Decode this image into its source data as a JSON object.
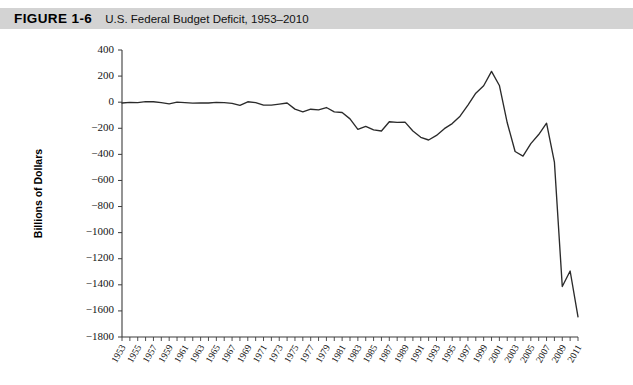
{
  "header": {
    "figure_number": "FIGURE 1-6",
    "figure_title": "U.S. Federal Budget Deficit, 1953–2010",
    "band_color": "#d3d3d3"
  },
  "chart_data": {
    "type": "line",
    "title": "U.S. Federal Budget Deficit, 1953–2010",
    "xlabel": "",
    "ylabel": "Billions of Dollars",
    "xlim": [
      1953,
      2011
    ],
    "ylim": [
      -1800,
      400
    ],
    "ytick_step": 200,
    "grid": false,
    "legend": "none",
    "line_color": "#2b2b2b",
    "ytick_labels": [
      "400",
      "200",
      "0",
      "−200",
      "−400",
      "−600",
      "−800",
      "−1000",
      "−1200",
      "−1400",
      "−1600",
      "−1800"
    ],
    "ytick_values": [
      400,
      200,
      0,
      -200,
      -400,
      -600,
      -800,
      -1000,
      -1200,
      -1400,
      -1600,
      -1800
    ],
    "xtick_labels": [
      "1953",
      "1955",
      "1957",
      "1959",
      "1961",
      "1963",
      "1965",
      "1967",
      "1969",
      "1971",
      "1973",
      "1975",
      "1977",
      "1979",
      "1981",
      "1983",
      "1985",
      "1987",
      "1989",
      "1991",
      "1993",
      "1995",
      "1997",
      "1999",
      "2001",
      "2003",
      "2005",
      "2007",
      "2009",
      "2011"
    ],
    "xtick_values": [
      1953,
      1955,
      1957,
      1959,
      1961,
      1963,
      1965,
      1967,
      1969,
      1971,
      1973,
      1975,
      1977,
      1979,
      1981,
      1983,
      1985,
      1987,
      1989,
      1991,
      1993,
      1995,
      1997,
      1999,
      2001,
      2003,
      2005,
      2007,
      2009,
      2011
    ],
    "x": [
      1953,
      1954,
      1955,
      1956,
      1957,
      1958,
      1959,
      1960,
      1961,
      1962,
      1963,
      1964,
      1965,
      1966,
      1967,
      1968,
      1969,
      1970,
      1971,
      1972,
      1973,
      1974,
      1975,
      1976,
      1977,
      1978,
      1979,
      1980,
      1981,
      1982,
      1983,
      1984,
      1985,
      1986,
      1987,
      1988,
      1989,
      1990,
      1991,
      1992,
      1993,
      1994,
      1995,
      1996,
      1997,
      1998,
      1999,
      2000,
      2001,
      2002,
      2003,
      2004,
      2005,
      2006,
      2007,
      2008,
      2009,
      2010,
      2011
    ],
    "values": [
      -6,
      -1,
      -3,
      4,
      3,
      -3,
      -13,
      0,
      -3,
      -7,
      -5,
      -6,
      -1,
      -4,
      -9,
      -25,
      3,
      -3,
      -23,
      -23,
      -15,
      -6,
      -53,
      -74,
      -54,
      -59,
      -41,
      -74,
      -79,
      -128,
      -208,
      -185,
      -212,
      -221,
      -150,
      -155,
      -153,
      -221,
      -269,
      -290,
      -255,
      -203,
      -164,
      -107,
      -22,
      69,
      126,
      236,
      128,
      -158,
      -378,
      -413,
      -318,
      -248,
      -161,
      -459,
      -1413,
      -1294,
      -1645
    ],
    "annotations": []
  },
  "axis": {
    "y_title": "Billions of Dollars"
  }
}
